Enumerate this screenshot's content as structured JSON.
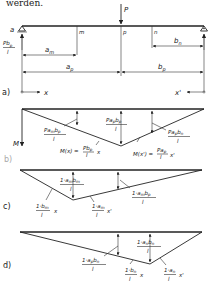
{
  "header_text": "werden.",
  "panel_a": {
    "caption": "a)",
    "load_label": "P",
    "support_left_label": "a",
    "reaction_left": {
      "num": "Pb",
      "num_sub": "p",
      "den": "l"
    },
    "points": [
      "m",
      "p",
      "n"
    ],
    "dims": {
      "a_m": "a",
      "a_m_sub": "m",
      "a_p": "a",
      "a_p_sub": "p",
      "b_n": "b",
      "b_n_sub": "n",
      "b_p": "b",
      "b_p_sub": "p"
    },
    "x_axis_left": "x",
    "x_axis_right": "x'"
  },
  "panel_b": {
    "caption": "b)",
    "axis_label": "M",
    "ord_left": {
      "num": "Pa",
      "num_sub": "m",
      "num2": "b",
      "num2_sub": "p",
      "den": "l"
    },
    "ord_mid": {
      "num": "Pa",
      "num_sub": "p",
      "num2": "b",
      "num2_sub": "p",
      "den": "l"
    },
    "ord_right": {
      "num": "Pa",
      "num_sub": "p",
      "num2": "b",
      "num2_sub": "n",
      "den": "l"
    },
    "eq_left": {
      "prefix": "M(x) =",
      "num": "Pb",
      "num_sub": "p",
      "den": "l",
      "var": "x"
    },
    "eq_right": {
      "prefix": "M(x') =",
      "num": "Pa",
      "num_sub": "p",
      "den": "l",
      "var": "x'"
    }
  },
  "panel_c": {
    "caption": "c)",
    "ord_mid": {
      "num": "1·a",
      "num_sub": "m",
      "num2": "b",
      "num2_sub": "m",
      "den": "l"
    },
    "ord_right": {
      "num": "1·a",
      "num_sub": "m",
      "num2": "b",
      "num2_sub": "p",
      "den": "l"
    },
    "slope_left": {
      "num": "1·b",
      "num_sub": "m",
      "den": "l",
      "var": "x"
    },
    "slope_right": {
      "num": "1·a",
      "num_sub": "m",
      "den": "l",
      "var": "x'"
    }
  },
  "panel_d": {
    "caption": "d)",
    "ord_left": {
      "num": "1·a",
      "num_sub": "p",
      "num2": "b",
      "num2_sub": "n",
      "den": "l"
    },
    "ord_mid": {
      "num": "1·a",
      "num_sub": "n",
      "num2": "b",
      "num2_sub": "n",
      "den": "l"
    },
    "slope_left": {
      "num": "1·b",
      "num_sub": "n",
      "den": "l",
      "var": "x"
    },
    "slope_right": {
      "num": "1·a",
      "num_sub": "n",
      "den": "l",
      "var": "x'"
    }
  }
}
